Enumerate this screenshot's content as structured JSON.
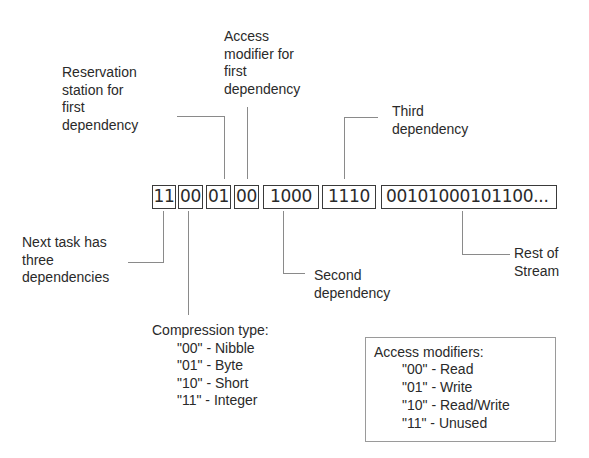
{
  "bitstream": {
    "segments": [
      {
        "id": "dep-count",
        "bits": "11"
      },
      {
        "id": "compression",
        "bits": "00"
      },
      {
        "id": "reservation-station-1",
        "bits": "01"
      },
      {
        "id": "access-modifier-1",
        "bits": "00"
      },
      {
        "id": "dependency-2",
        "bits": "1000"
      },
      {
        "id": "dependency-3",
        "bits": "1110"
      },
      {
        "id": "rest",
        "bits": "00101000101100..."
      }
    ]
  },
  "annotations": {
    "reservation_station": "Reservation\nstation for\nfirst\ndependency",
    "access_modifier": "Access\nmodifier for\nfirst\ndependency",
    "third_dependency": "Third\ndependency",
    "next_task": "Next task has\nthree\ndependencies",
    "second_dependency": "Second\ndependency",
    "rest_of_stream": "Rest of\nStream"
  },
  "compression_type": {
    "title": "Compression type:",
    "items": [
      "\"00\" - Nibble",
      "\"01\" - Byte",
      "\"10\" - Short",
      "\"11\" - Integer"
    ]
  },
  "access_modifiers": {
    "title": "Access modifiers:",
    "items": [
      "\"00\" - Read",
      "\"01\" - Write",
      "\"10\" - Read/Write",
      "\"11\" - Unused"
    ]
  }
}
